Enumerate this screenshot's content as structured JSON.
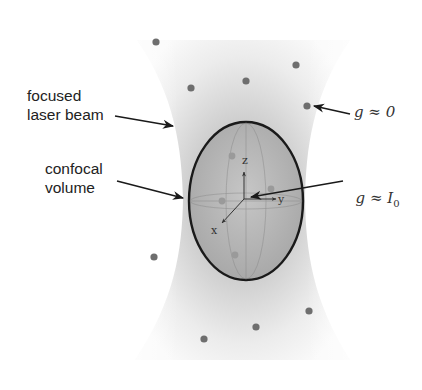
{
  "labels": {
    "beam": "focused\nlaser beam",
    "confocal": "confocal\nvolume",
    "g_outside": "g ≈ 0",
    "g_inside_prefix": "g ≈ I",
    "g_inside_sub": "0"
  },
  "axes": {
    "x": "x",
    "y": "y",
    "z": "z"
  },
  "colors": {
    "beam_dark": "#b8b8b8",
    "beam_light": "#f2f2f2",
    "ellipse_fill": "#b0b0b0",
    "ellipse_stroke": "#1a1a1a",
    "particle": "#6e6e6e",
    "particle_inside": "#9a9a9a",
    "arrow": "#1a1a1a"
  },
  "particles_outside": [
    [
      156,
      42
    ],
    [
      191,
      88
    ],
    [
      246,
      81
    ],
    [
      296,
      65
    ],
    [
      307,
      106
    ],
    [
      154,
      257
    ],
    [
      204,
      339
    ],
    [
      256,
      327
    ],
    [
      309,
      311
    ]
  ],
  "particles_inside": [
    [
      232,
      156
    ],
    [
      222,
      201
    ],
    [
      271,
      189
    ],
    [
      235,
      255
    ]
  ],
  "ellipse": {
    "cx": 246,
    "cy": 201,
    "rx": 57,
    "ry": 79
  }
}
